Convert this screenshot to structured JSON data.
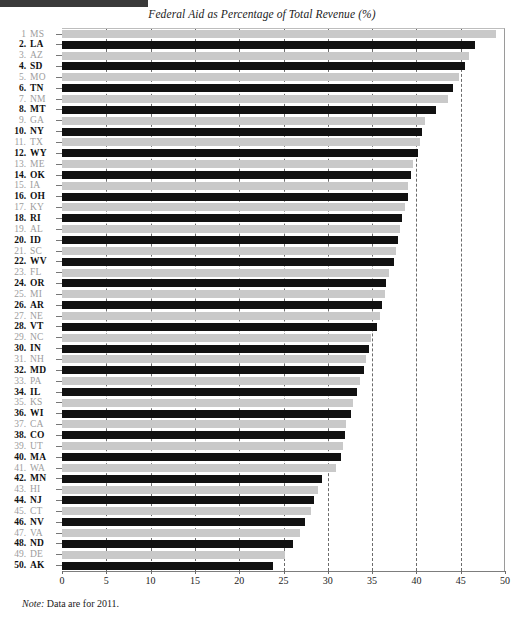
{
  "header": {
    "top_bar": true
  },
  "chart_data": {
    "type": "bar",
    "orientation": "horizontal",
    "title": "Federal Aid as Percentage of Total Revenue (%)",
    "xlabel": "",
    "ylabel": "",
    "xlim": [
      0,
      50
    ],
    "xticks": [
      0,
      5,
      10,
      15,
      20,
      25,
      30,
      35,
      40,
      45,
      50
    ],
    "grid": "vertical-dashed",
    "legend": "none",
    "note": "Note: Data are for 2011.",
    "note_lead": "Note:",
    "note_body": " Data are for 2011.",
    "colors": {
      "bar_dark": "#111111",
      "bar_light": "#c9c9c9",
      "label_dark": "#111111",
      "label_light": "#9d9d9d",
      "gridline": "#6b6b6b",
      "axis": "#7d7d7d"
    },
    "categories": [
      "MS",
      "LA",
      "AZ",
      "SD",
      "MO",
      "TN",
      "NM",
      "MT",
      "GA",
      "NY",
      "TX",
      "WY",
      "ME",
      "OK",
      "IA",
      "OH",
      "KY",
      "RI",
      "AL",
      "ID",
      "SC",
      "WV",
      "FL",
      "OR",
      "MI",
      "AR",
      "NE",
      "VT",
      "NC",
      "IN",
      "NH",
      "MD",
      "PA",
      "IL",
      "KS",
      "WI",
      "CA",
      "CO",
      "UT",
      "MA",
      "WA",
      "MN",
      "HI",
      "NJ",
      "CT",
      "NV",
      "VA",
      "ND",
      "DE",
      "AK"
    ],
    "values": [
      49.0,
      46.6,
      45.9,
      45.5,
      44.8,
      44.1,
      43.6,
      42.2,
      41.0,
      40.6,
      40.4,
      40.2,
      39.6,
      39.4,
      39.1,
      39.0,
      38.7,
      38.4,
      38.1,
      37.9,
      37.7,
      37.5,
      36.9,
      36.6,
      36.4,
      36.1,
      35.9,
      35.5,
      34.9,
      34.6,
      34.3,
      34.1,
      33.6,
      33.3,
      32.8,
      32.6,
      32.1,
      31.9,
      31.7,
      31.5,
      30.9,
      29.4,
      28.9,
      28.4,
      28.1,
      27.4,
      26.9,
      26.1,
      25.2,
      23.8
    ],
    "rows": [
      {
        "rank": "1",
        "state": "MS",
        "value": 49.0,
        "shade": "light"
      },
      {
        "rank": "2.",
        "state": "LA",
        "value": 46.6,
        "shade": "dark"
      },
      {
        "rank": "3.",
        "state": "AZ",
        "value": 45.9,
        "shade": "light"
      },
      {
        "rank": "4.",
        "state": "SD",
        "value": 45.5,
        "shade": "dark"
      },
      {
        "rank": "5.",
        "state": "MO",
        "value": 44.8,
        "shade": "light"
      },
      {
        "rank": "6.",
        "state": "TN",
        "value": 44.1,
        "shade": "dark"
      },
      {
        "rank": "7.",
        "state": "NM",
        "value": 43.6,
        "shade": "light"
      },
      {
        "rank": "8.",
        "state": "MT",
        "value": 42.2,
        "shade": "dark"
      },
      {
        "rank": "9.",
        "state": "GA",
        "value": 41.0,
        "shade": "light"
      },
      {
        "rank": "10.",
        "state": "NY",
        "value": 40.6,
        "shade": "dark"
      },
      {
        "rank": "11.",
        "state": "TX",
        "value": 40.4,
        "shade": "light"
      },
      {
        "rank": "12.",
        "state": "WY",
        "value": 40.2,
        "shade": "dark"
      },
      {
        "rank": "13.",
        "state": "ME",
        "value": 39.6,
        "shade": "light"
      },
      {
        "rank": "14.",
        "state": "OK",
        "value": 39.4,
        "shade": "dark"
      },
      {
        "rank": "15.",
        "state": "IA",
        "value": 39.1,
        "shade": "light"
      },
      {
        "rank": "16.",
        "state": "OH",
        "value": 39.0,
        "shade": "dark"
      },
      {
        "rank": "17.",
        "state": "KY",
        "value": 38.7,
        "shade": "light"
      },
      {
        "rank": "18.",
        "state": "RI",
        "value": 38.4,
        "shade": "dark"
      },
      {
        "rank": "19.",
        "state": "AL",
        "value": 38.1,
        "shade": "light"
      },
      {
        "rank": "20.",
        "state": "ID",
        "value": 37.9,
        "shade": "dark"
      },
      {
        "rank": "21.",
        "state": "SC",
        "value": 37.7,
        "shade": "light"
      },
      {
        "rank": "22.",
        "state": "WV",
        "value": 37.5,
        "shade": "dark"
      },
      {
        "rank": "23.",
        "state": "FL",
        "value": 36.9,
        "shade": "light"
      },
      {
        "rank": "24.",
        "state": "OR",
        "value": 36.6,
        "shade": "dark"
      },
      {
        "rank": "25.",
        "state": "MI",
        "value": 36.4,
        "shade": "light"
      },
      {
        "rank": "26.",
        "state": "AR",
        "value": 36.1,
        "shade": "dark"
      },
      {
        "rank": "27.",
        "state": "NE",
        "value": 35.9,
        "shade": "light"
      },
      {
        "rank": "28.",
        "state": "VT",
        "value": 35.5,
        "shade": "dark"
      },
      {
        "rank": "29.",
        "state": "NC",
        "value": 34.9,
        "shade": "light"
      },
      {
        "rank": "30.",
        "state": "IN",
        "value": 34.6,
        "shade": "dark"
      },
      {
        "rank": "31.",
        "state": "NH",
        "value": 34.3,
        "shade": "light"
      },
      {
        "rank": "32.",
        "state": "MD",
        "value": 34.1,
        "shade": "dark"
      },
      {
        "rank": "33.",
        "state": "PA",
        "value": 33.6,
        "shade": "light"
      },
      {
        "rank": "34.",
        "state": "IL",
        "value": 33.3,
        "shade": "dark"
      },
      {
        "rank": "35.",
        "state": "KS",
        "value": 32.8,
        "shade": "light"
      },
      {
        "rank": "36.",
        "state": "WI",
        "value": 32.6,
        "shade": "dark"
      },
      {
        "rank": "37.",
        "state": "CA",
        "value": 32.1,
        "shade": "light"
      },
      {
        "rank": "38.",
        "state": "CO",
        "value": 31.9,
        "shade": "dark"
      },
      {
        "rank": "39.",
        "state": "UT",
        "value": 31.7,
        "shade": "light"
      },
      {
        "rank": "40.",
        "state": "MA",
        "value": 31.5,
        "shade": "dark"
      },
      {
        "rank": "41.",
        "state": "WA",
        "value": 30.9,
        "shade": "light"
      },
      {
        "rank": "42.",
        "state": "MN",
        "value": 29.4,
        "shade": "dark"
      },
      {
        "rank": "43.",
        "state": "HI",
        "value": 28.9,
        "shade": "light"
      },
      {
        "rank": "44.",
        "state": "NJ",
        "value": 28.4,
        "shade": "dark"
      },
      {
        "rank": "45.",
        "state": "CT",
        "value": 28.1,
        "shade": "light"
      },
      {
        "rank": "46.",
        "state": "NV",
        "value": 27.4,
        "shade": "dark"
      },
      {
        "rank": "47.",
        "state": "VA",
        "value": 26.9,
        "shade": "light"
      },
      {
        "rank": "48.",
        "state": "ND",
        "value": 26.1,
        "shade": "dark"
      },
      {
        "rank": "49.",
        "state": "DE",
        "value": 25.2,
        "shade": "light"
      },
      {
        "rank": "50.",
        "state": "AK",
        "value": 23.8,
        "shade": "dark"
      }
    ]
  }
}
